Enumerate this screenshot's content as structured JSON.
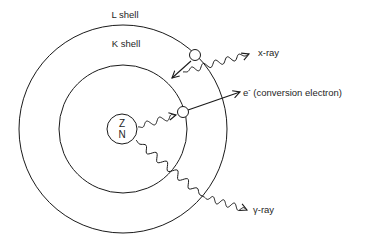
{
  "diagram": {
    "shells": {
      "l_shell_label": "L shell",
      "k_shell_label": "K shell"
    },
    "nucleus": {
      "line1": "Z",
      "line2": "N"
    },
    "labels": {
      "xray": "x-ray",
      "electron_symbol": "e",
      "electron_charge": "-",
      "conversion_electron": " (conversion electron)",
      "gamma_ray": "γ-ray"
    },
    "colors": {
      "stroke": "#1a1a1a",
      "background": "#ffffff"
    }
  }
}
